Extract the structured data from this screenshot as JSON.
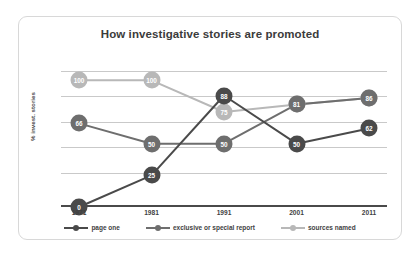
{
  "chart_data": {
    "type": "line",
    "title": "How investigative stories are promoted",
    "xlabel": "",
    "ylabel": "% invest. stories",
    "categories": [
      "1971",
      "1981",
      "1991",
      "2001",
      "2011"
    ],
    "ylim": [
      0,
      120
    ],
    "grid": true,
    "legend_position": "bottom",
    "series": [
      {
        "name": "page one",
        "color": "#4a4a4a",
        "values": [
          0,
          25,
          88,
          50,
          62
        ]
      },
      {
        "name": "exclusive or special report",
        "color": "#6e6e6e",
        "values": [
          66,
          50,
          50,
          81,
          86
        ]
      },
      {
        "name": "sources named",
        "color": "#b8b8b8",
        "values": [
          100,
          100,
          75,
          81,
          86
        ]
      }
    ]
  },
  "card": {
    "border_color": "#d8d8d8",
    "background": "#ffffff"
  },
  "axis": {
    "gridline_color": "#c9c9c9",
    "axis_color": "#4a4a4a"
  }
}
